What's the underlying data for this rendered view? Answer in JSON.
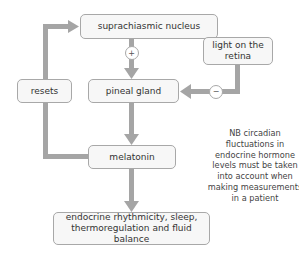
{
  "diagram": {
    "nodes": {
      "scn": "suprachiasmic nucleus",
      "light": "light on the retina",
      "resets": "resets",
      "pineal": "pineal gland",
      "melatonin": "melatonin",
      "outcome": "endocrine rhythmicity, sleep, thermoregulation and fluid balance"
    },
    "signs": {
      "scn_to_pineal": "+",
      "light_to_pineal": "−"
    },
    "note": "NB circadian fluctuations in endocrine hormone levels must be taken into account when making measurements in a patient",
    "colors": {
      "arrow": "#a5a5a5",
      "box_fill": "#f7f7f7",
      "box_border": "#a8a8a8"
    }
  }
}
